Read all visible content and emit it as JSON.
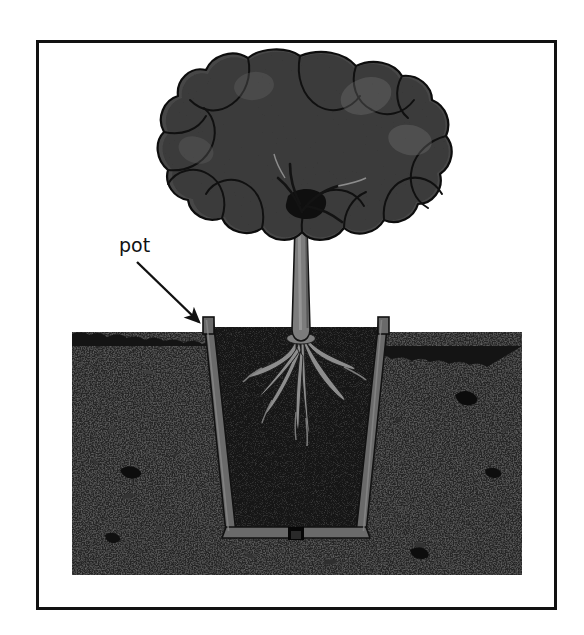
{
  "figure": {
    "kind": "cross-section-illustration",
    "background_color": "#ffffff",
    "frame": {
      "border_color": "#111111",
      "border_width_px": 3,
      "x": 36,
      "y": 40,
      "width": 521,
      "height": 570
    }
  },
  "annotations": [
    {
      "name": "pot-label",
      "text": "pot",
      "text_color": "#111111",
      "font_size_px": 19,
      "x": 119,
      "y": 252,
      "leader": {
        "name": "pot-leader-arrow",
        "type": "arrow",
        "color": "#111111",
        "from_x": 137,
        "from_y": 262,
        "to_x": 199,
        "to_y": 322
      }
    }
  ],
  "scene": {
    "ground": {
      "name": "soil-ground",
      "label": "soil",
      "fill_color": "#1b1b1b",
      "speckle_color": "#3c3c3c",
      "x": 72,
      "y": 332,
      "width": 450,
      "height": 243,
      "surface_line_color": "#0a0a0a"
    },
    "pot": {
      "name": "pot",
      "label": "pot",
      "material_color": "#6a6a6a",
      "edge_color": "#111111",
      "wall_thickness_px": 9,
      "shape": "tapered-cylinder-cross-section",
      "rim_left_x": 204,
      "rim_right_x": 388,
      "rim_top_y": 318,
      "base_left_x": 226,
      "base_right_x": 366,
      "base_y": 533,
      "interior_fill_color": "#0e0e0e",
      "drainage_hole": {
        "name": "pot-drainage-hole",
        "center_x": 296,
        "y": 534,
        "width": 16
      }
    },
    "tree": {
      "name": "tree",
      "canopy": {
        "name": "tree-canopy",
        "fill_color": "#4a4a4a",
        "outline_color": "#0d0d0d",
        "highlight_color": "#5f5f5f",
        "center_x": 300,
        "center_y": 160,
        "radius_x": 108,
        "radius_y": 104
      },
      "trunk": {
        "name": "tree-trunk",
        "fill_color": "#7a7a7a",
        "outline_color": "#141414",
        "top_y": 210,
        "ground_y": 340,
        "width_top_px": 11,
        "width_bottom_px": 15,
        "center_x": 301
      },
      "roots": {
        "name": "tree-roots",
        "fill_color": "#8b8b8b",
        "outline_color": "#1a1a1a",
        "origin_x": 301,
        "origin_y": 344,
        "max_depth_y": 452,
        "spread_left_x": 252,
        "spread_right_x": 352,
        "count": 7
      }
    }
  }
}
